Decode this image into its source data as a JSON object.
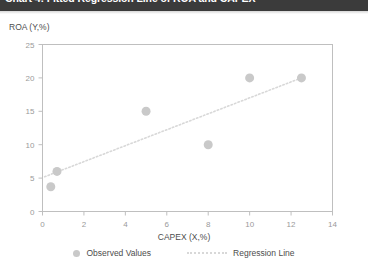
{
  "header": {
    "title": "Chart 4: Fitted Regression Line of ROA and CAPEX",
    "bar_color": "#3b3b3b",
    "title_color": "#ffffff"
  },
  "legend": {
    "position": "bottom-center",
    "items": [
      {
        "label": "Observed Values",
        "marker": "dot",
        "color": "#c9c9c9"
      },
      {
        "label": "Regression Line",
        "marker": "dotted-line",
        "color": "#d8d8d8"
      }
    ]
  },
  "chart_data": {
    "type": "scatter",
    "title": "Chart 4: Fitted Regression Line of ROA and CAPEX",
    "xlabel": "CAPEX (X,%)",
    "ylabel": "ROA (Y,%)",
    "xlim": [
      0,
      14
    ],
    "ylim": [
      0,
      25
    ],
    "xticks": [
      0,
      2,
      4,
      6,
      8,
      10,
      12,
      14
    ],
    "yticks": [
      0,
      5,
      10,
      15,
      20,
      25
    ],
    "xtick_labels": [
      "0",
      "2",
      "4",
      "6",
      "8",
      "10",
      "12",
      "14"
    ],
    "ytick_labels": [
      "0",
      "5",
      "10",
      "15",
      "20",
      "25"
    ],
    "grid": false,
    "series": [
      {
        "name": "Observed Values",
        "type": "scatter",
        "color": "#c9c9c9",
        "marker_size": 9,
        "points": [
          {
            "x": 0.4,
            "y": 3.7
          },
          {
            "x": 0.7,
            "y": 6.0
          },
          {
            "x": 5.0,
            "y": 15.0
          },
          {
            "x": 8.0,
            "y": 10.0
          },
          {
            "x": 10.0,
            "y": 20.0
          },
          {
            "x": 12.5,
            "y": 20.0
          }
        ]
      },
      {
        "name": "Regression Line",
        "type": "line",
        "style": "dotted",
        "color": "#d8d8d8",
        "points": [
          {
            "x": 0.1,
            "y": 5.2
          },
          {
            "x": 12.5,
            "y": 20.0
          }
        ]
      }
    ]
  }
}
